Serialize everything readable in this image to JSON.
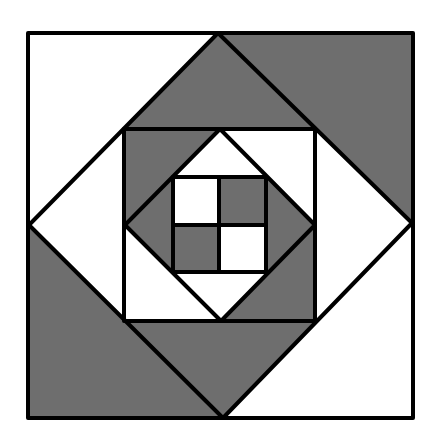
{
  "figure": {
    "title": "Square-in-a-square quilt block",
    "canvas": {
      "width": 437,
      "height": 446
    },
    "colors": {
      "background": "#ffffff",
      "light": "#ffffff",
      "dark": "#6e6e6e",
      "stroke": "#000000"
    },
    "stroke_width": 4,
    "regions": [
      {
        "name": "outer-corner-top-left",
        "fill": "light",
        "points": [
          [
            28,
            33
          ],
          [
            218,
            33
          ],
          [
            29,
            225
          ]
        ]
      },
      {
        "name": "outer-corner-top-right",
        "fill": "dark",
        "points": [
          [
            218,
            33
          ],
          [
            413,
            33
          ],
          [
            412,
            223
          ]
        ]
      },
      {
        "name": "outer-corner-bottom-right",
        "fill": "light",
        "points": [
          [
            412,
            223
          ],
          [
            413,
            418
          ],
          [
            223,
            418
          ]
        ]
      },
      {
        "name": "outer-corner-bottom-left",
        "fill": "dark",
        "points": [
          [
            29,
            225
          ],
          [
            223,
            418
          ],
          [
            28,
            418
          ]
        ]
      },
      {
        "name": "diamond-triangle-top",
        "fill": "dark",
        "points": [
          [
            218,
            33
          ],
          [
            315,
            129
          ],
          [
            124,
            129
          ]
        ]
      },
      {
        "name": "diamond-triangle-right",
        "fill": "light",
        "points": [
          [
            412,
            223
          ],
          [
            315,
            321
          ],
          [
            315,
            129
          ]
        ]
      },
      {
        "name": "diamond-triangle-bottom",
        "fill": "dark",
        "points": [
          [
            223,
            418
          ],
          [
            124,
            321
          ],
          [
            315,
            321
          ]
        ]
      },
      {
        "name": "diamond-triangle-left",
        "fill": "light",
        "points": [
          [
            29,
            225
          ],
          [
            124,
            129
          ],
          [
            124,
            321
          ]
        ]
      },
      {
        "name": "mid-corner-top-left",
        "fill": "dark",
        "points": [
          [
            124,
            129
          ],
          [
            220,
            129
          ],
          [
            125,
            225
          ]
        ]
      },
      {
        "name": "mid-corner-top-right",
        "fill": "light",
        "points": [
          [
            220,
            129
          ],
          [
            315,
            129
          ],
          [
            315,
            225
          ]
        ]
      },
      {
        "name": "mid-corner-bottom-right",
        "fill": "dark",
        "points": [
          [
            315,
            225
          ],
          [
            315,
            321
          ],
          [
            221,
            321
          ]
        ]
      },
      {
        "name": "mid-corner-bottom-left",
        "fill": "light",
        "points": [
          [
            125,
            225
          ],
          [
            221,
            321
          ],
          [
            124,
            321
          ]
        ]
      },
      {
        "name": "inner-diamond-triangle-top",
        "fill": "light",
        "points": [
          [
            220,
            129
          ],
          [
            266,
            177
          ],
          [
            173,
            177
          ]
        ]
      },
      {
        "name": "inner-diamond-triangle-right",
        "fill": "dark",
        "points": [
          [
            315,
            225
          ],
          [
            266,
            272
          ],
          [
            266,
            177
          ]
        ]
      },
      {
        "name": "inner-diamond-triangle-bottom",
        "fill": "light",
        "points": [
          [
            221,
            321
          ],
          [
            173,
            272
          ],
          [
            266,
            272
          ]
        ]
      },
      {
        "name": "inner-diamond-triangle-left",
        "fill": "dark",
        "points": [
          [
            125,
            225
          ],
          [
            173,
            177
          ],
          [
            173,
            272
          ]
        ]
      },
      {
        "name": "center-cell-top-left",
        "fill": "light",
        "points": [
          [
            173,
            177
          ],
          [
            219,
            177
          ],
          [
            219,
            225
          ],
          [
            173,
            225
          ]
        ]
      },
      {
        "name": "center-cell-top-right",
        "fill": "dark",
        "points": [
          [
            219,
            177
          ],
          [
            266,
            177
          ],
          [
            266,
            225
          ],
          [
            219,
            225
          ]
        ]
      },
      {
        "name": "center-cell-bottom-left",
        "fill": "dark",
        "points": [
          [
            173,
            225
          ],
          [
            219,
            225
          ],
          [
            219,
            272
          ],
          [
            173,
            272
          ]
        ]
      },
      {
        "name": "center-cell-bottom-right",
        "fill": "light",
        "points": [
          [
            219,
            225
          ],
          [
            266,
            225
          ],
          [
            266,
            272
          ],
          [
            219,
            272
          ]
        ]
      }
    ],
    "outlines": [
      {
        "name": "outer-square",
        "points": [
          [
            28,
            33
          ],
          [
            413,
            33
          ],
          [
            413,
            418
          ],
          [
            28,
            418
          ]
        ]
      },
      {
        "name": "outer-diamond",
        "points": [
          [
            218,
            33
          ],
          [
            412,
            223
          ],
          [
            223,
            418
          ],
          [
            29,
            225
          ]
        ]
      },
      {
        "name": "middle-square",
        "points": [
          [
            124,
            129
          ],
          [
            315,
            129
          ],
          [
            315,
            321
          ],
          [
            124,
            321
          ]
        ]
      },
      {
        "name": "inner-diamond",
        "points": [
          [
            220,
            129
          ],
          [
            315,
            225
          ],
          [
            221,
            321
          ],
          [
            125,
            225
          ]
        ]
      },
      {
        "name": "inner-square",
        "points": [
          [
            173,
            177
          ],
          [
            266,
            177
          ],
          [
            266,
            272
          ],
          [
            173,
            272
          ]
        ]
      }
    ],
    "lines": [
      {
        "name": "center-vertical-divider",
        "from": [
          219,
          177
        ],
        "to": [
          219,
          272
        ]
      },
      {
        "name": "center-horizontal-divider",
        "from": [
          173,
          225
        ],
        "to": [
          266,
          225
        ]
      }
    ]
  }
}
